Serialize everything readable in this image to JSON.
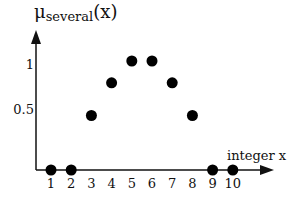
{
  "chart_data": {
    "type": "scatter",
    "title_main": "μ",
    "title_sub": "several",
    "title_arg": "(x)",
    "xlabel": "integer x",
    "ylabel": "μ_several(x)",
    "x": [
      1,
      2,
      3,
      4,
      5,
      6,
      7,
      8,
      9,
      10
    ],
    "values": [
      0,
      0,
      0.5,
      0.8,
      1,
      1,
      0.8,
      0.5,
      0,
      0
    ],
    "x_tick_labels": [
      "1",
      "2",
      "3",
      "4",
      "5",
      "6",
      "7",
      "8",
      "9",
      "10"
    ],
    "y_tick_labels": [
      "0.5",
      "1"
    ],
    "y_ticks": [
      0.5,
      1
    ],
    "ylim": [
      0,
      1.2
    ],
    "xlim": [
      0,
      11
    ],
    "grid": false,
    "legend": null,
    "marker_color": "#000000"
  }
}
